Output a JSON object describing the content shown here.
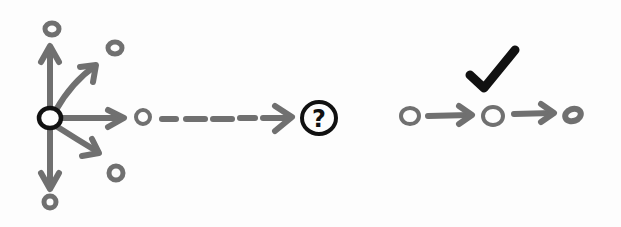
{
  "diagram": {
    "left": {
      "center_node": "start-node",
      "branches": [
        "up",
        "up-right",
        "right",
        "down-right",
        "down"
      ],
      "continuation": "dashed-arrow",
      "target_label": "?"
    },
    "right": {
      "check_label": "checkmark",
      "chain": [
        "node",
        "node",
        "node"
      ]
    },
    "colors": {
      "arrows": "#707070",
      "highlight": "#111111",
      "background": "#fdfdfd"
    }
  }
}
